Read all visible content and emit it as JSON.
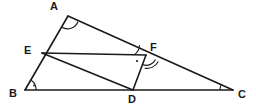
{
  "figure": {
    "type": "geometry-diagram",
    "width": 256,
    "height": 110,
    "background_color": "#ffffff",
    "stroke_color": "#1a1a1a",
    "stroke_width": 1.6
  },
  "points": [
    {
      "name": "A",
      "label": "A",
      "x": 68,
      "y": 16,
      "label_x": 50,
      "label_y": 1
    },
    {
      "name": "B",
      "label": "B",
      "x": 25,
      "y": 90,
      "label_x": 9,
      "label_y": 88
    },
    {
      "name": "C",
      "label": "C",
      "x": 233,
      "y": 90,
      "label_x": 238,
      "label_y": 89
    },
    {
      "name": "D",
      "label": "D",
      "x": 133,
      "y": 90,
      "label_x": 128,
      "label_y": 94
    },
    {
      "name": "E",
      "label": "E",
      "x": 42,
      "y": 53,
      "label_x": 24,
      "label_y": 45
    },
    {
      "name": "F",
      "label": "F",
      "x": 146,
      "y": 55,
      "label_x": 150,
      "label_y": 42
    }
  ],
  "segments": [
    {
      "name": "AB",
      "from": "A",
      "to": "B"
    },
    {
      "name": "AC",
      "from": "A",
      "to": "C"
    },
    {
      "name": "BC",
      "from": "B",
      "to": "C"
    },
    {
      "name": "EF",
      "from": "E",
      "to": "F"
    },
    {
      "name": "ED",
      "from": "E",
      "to": "D"
    },
    {
      "name": "FD",
      "from": "F",
      "to": "D"
    }
  ],
  "angle_marks": [
    {
      "name": "angle-at-A",
      "vertex": "A",
      "style": "single-arc",
      "radius": 11
    },
    {
      "name": "angle-at-B",
      "vertex": "B",
      "style": "single-arc-with-dot",
      "radius": 11
    },
    {
      "name": "angle-at-C",
      "vertex": "C",
      "style": "single-arc",
      "radius": 13
    },
    {
      "name": "angle-at-F-EFA",
      "vertex": "F",
      "style": "single-arc",
      "radius": 12
    },
    {
      "name": "angle-at-F-DFC",
      "vertex": "F",
      "style": "double-arc",
      "radius": 10
    }
  ],
  "point_marks": [
    {
      "name": "right-angle-dot-near-F",
      "x": 137,
      "y": 61
    }
  ]
}
